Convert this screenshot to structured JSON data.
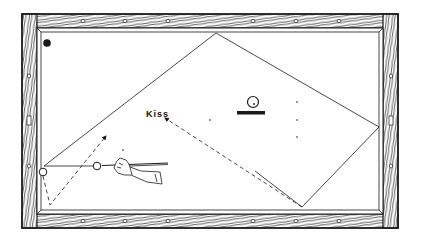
{
  "diagram": {
    "labels": {
      "kiss": "Kiss"
    },
    "colors": {
      "ink": "#1a1a1a",
      "felt": "#ffffff",
      "rail_wood": "#ffffff"
    },
    "table": {
      "outer": {
        "x": 22,
        "y": 14,
        "w": 376,
        "h": 214
      },
      "inner": {
        "x": 37,
        "y": 28,
        "w": 346,
        "h": 186
      },
      "diamonds_top_x": [
        83,
        125,
        168,
        253,
        296,
        339
      ],
      "diamonds_bottom_x": [
        83,
        125,
        168,
        253,
        296,
        339
      ],
      "diamonds_side_y": [
        76,
        121,
        166
      ]
    },
    "balls": [
      {
        "name": "pocketed-ball",
        "x": 47,
        "y": 43,
        "r": 3.5,
        "filled": true
      },
      {
        "name": "object-ball",
        "x": 43,
        "y": 172,
        "r": 3.5,
        "filled": false
      },
      {
        "name": "cue-ball",
        "x": 97,
        "y": 166,
        "r": 3.5,
        "filled": false
      },
      {
        "name": "spot-ball",
        "x": 253,
        "y": 104,
        "r": 5,
        "filled": false
      }
    ],
    "paths": {
      "cue_ball_solid": [
        [
          97,
          166
        ],
        [
          44,
          166
        ],
        [
          216,
          33
        ],
        [
          379,
          127
        ],
        [
          302,
          207
        ],
        [
          255,
          170
        ]
      ],
      "kiss_dashed": [
        [
          302,
          207
        ],
        [
          165,
          118
        ]
      ],
      "object_ball_dashed": [
        [
          43,
          172
        ],
        [
          50,
          205
        ],
        [
          106,
          136
        ]
      ]
    },
    "table_spots": [
      [
        123,
        150
      ],
      [
        210,
        120
      ],
      [
        297,
        102
      ],
      [
        297,
        120
      ],
      [
        297,
        137
      ]
    ]
  }
}
